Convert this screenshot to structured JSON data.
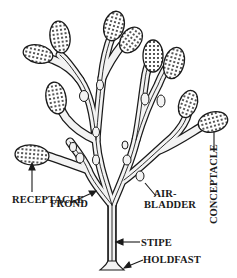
{
  "diagram": {
    "labels": {
      "receptacle": "RECEPTACLE",
      "frond": "FROND",
      "air_bladder_line1": "AIR-",
      "air_bladder_line2": "BLADDER",
      "stipe": "STIPE",
      "holdfast": "HOLDFAST",
      "conceptacle": "CONCEPTACLE"
    },
    "colors": {
      "ink": "#1a1a1a",
      "background": "#ffffff",
      "stipple": "#2a2a2a",
      "frond_fill": "#f2f2f2"
    }
  }
}
